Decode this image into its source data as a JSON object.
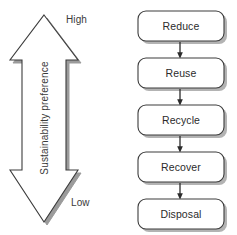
{
  "figure": {
    "width": 237,
    "height": 235,
    "background_color": "#ffffff"
  },
  "scale_arrow": {
    "name": "sustainability-preference-scale",
    "axis_title": "Sustainability preference",
    "top_label": "High",
    "bottom_label": "Low",
    "direction": "double-headed-vertical",
    "fill_color": "#ffffff",
    "stroke_color": "#3c3c3c",
    "shadow_color": "#9b9b9b"
  },
  "flow": {
    "name": "waste-hierarchy-flow",
    "orientation": "vertical-top-to-bottom",
    "box_fill_color": "#ffffff",
    "box_stroke_color": "#3c3c3c",
    "box_shadow_color": "#b0b0b0",
    "connector_color": "#2b2b2b",
    "steps": [
      {
        "label": "Reduce",
        "rank": 1
      },
      {
        "label": "Reuse",
        "rank": 2
      },
      {
        "label": "Recycle",
        "rank": 3
      },
      {
        "label": "Recover",
        "rank": 4
      },
      {
        "label": "Disposal",
        "rank": 5
      }
    ],
    "connector_count": 4
  }
}
